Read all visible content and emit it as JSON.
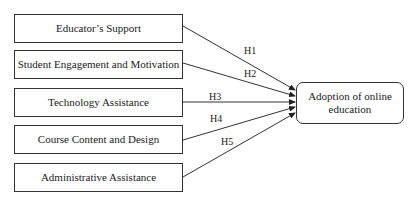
{
  "diagram": {
    "sources": [
      {
        "label": "Educator’s Support"
      },
      {
        "label": "Student Engagement and Motivation"
      },
      {
        "label": "Technology Assistance"
      },
      {
        "label": "Course Content and Design"
      },
      {
        "label": "Administrative Assistance"
      }
    ],
    "target": {
      "label": "Adoption of online education"
    },
    "hypotheses": [
      {
        "label": "H1",
        "from": 0
      },
      {
        "label": "H2",
        "from": 1
      },
      {
        "label": "H3",
        "from": 2
      },
      {
        "label": "H4",
        "from": 3
      },
      {
        "label": "H5",
        "from": 4
      }
    ],
    "colors": {
      "line": "#333333",
      "text": "#1a1a1a",
      "background": "#ffffff"
    }
  }
}
